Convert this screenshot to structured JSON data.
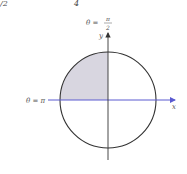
{
  "top_fragments": {
    "left": "/2",
    "right": "4"
  },
  "diagram": {
    "label_top_theta": "θ =",
    "label_top_num": "π",
    "label_top_den": "2",
    "label_left": "θ = π",
    "axis_y": "y",
    "axis_x": "x",
    "center": [
      108,
      100
    ],
    "radius": 48,
    "shaded_quadrant": "second",
    "colors": {
      "circle": "#333333",
      "axis_x": "#5a5ad0",
      "axis_y": "#333333",
      "fill": "#d8d6e0"
    }
  }
}
